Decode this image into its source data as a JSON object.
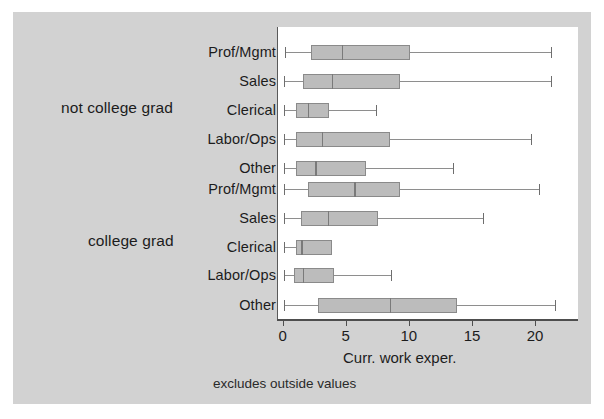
{
  "chart_data": {
    "type": "box",
    "title": "",
    "xlabel": "Curr. work exper.",
    "ylabel": "",
    "note": "excludes outside values",
    "xlim": [
      -0.45,
      23.4
    ],
    "xticks": [
      0,
      5,
      10,
      15,
      20
    ],
    "xticklabels": [
      "0",
      "5",
      "10",
      "15",
      "20"
    ],
    "grid": false,
    "legend": "none",
    "orientation": "horizontal",
    "groups": [
      {
        "label": "not college grad",
        "categories": [
          {
            "label": "Prof/Mgmt",
            "whisker_low": 0.1,
            "q1": 2.2,
            "median": 4.6,
            "q3": 10.0,
            "whisker_high": 21.3
          },
          {
            "label": "Sales",
            "whisker_low": 0.0,
            "q1": 1.5,
            "median": 3.8,
            "q3": 9.2,
            "whisker_high": 21.3
          },
          {
            "label": "Clerical",
            "whisker_low": 0.0,
            "q1": 1.0,
            "median": 1.9,
            "q3": 3.6,
            "whisker_high": 7.4
          },
          {
            "label": "Labor/Ops",
            "whisker_low": 0.0,
            "q1": 1.0,
            "median": 3.0,
            "q3": 8.4,
            "whisker_high": 19.7
          },
          {
            "label": "Other",
            "whisker_low": 0.0,
            "q1": 1.0,
            "median": 2.5,
            "q3": 6.5,
            "whisker_high": 13.5
          }
        ]
      },
      {
        "label": "college grad",
        "categories": [
          {
            "label": "Prof/Mgmt",
            "whisker_low": 0.0,
            "q1": 1.9,
            "median": 5.6,
            "q3": 9.2,
            "whisker_high": 20.3
          },
          {
            "label": "Sales",
            "whisker_low": 0.0,
            "q1": 1.4,
            "median": 3.5,
            "q3": 7.5,
            "whisker_high": 15.9
          },
          {
            "label": "Clerical",
            "whisker_low": 0.0,
            "q1": 1.0,
            "median": 1.4,
            "q3": 3.8,
            "whisker_high": 3.8
          },
          {
            "label": "Labor/Ops",
            "whisker_low": 0.0,
            "q1": 0.8,
            "median": 1.5,
            "q3": 4.0,
            "whisker_high": 8.6
          },
          {
            "label": "Other",
            "whisker_low": 0.0,
            "q1": 2.7,
            "median": 8.4,
            "q3": 13.7,
            "whisker_high": 21.6
          }
        ]
      }
    ],
    "colors": {
      "figure_background": "#d2d2d2",
      "plot_background": "#ffffff",
      "box_fill": "#bcbcbc",
      "box_edge": "#8a8a8a",
      "whisker": "#8e8e8e",
      "axis": "#4e4e4e",
      "text": "#1c1c1c"
    }
  }
}
